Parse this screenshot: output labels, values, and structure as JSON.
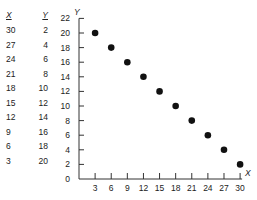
{
  "chart_data": {
    "type": "scatter",
    "title": "",
    "xlabel": "X",
    "ylabel": "Y",
    "xlim": [
      0,
      30
    ],
    "ylim": [
      0,
      22
    ],
    "x_ticks": [
      3,
      6,
      9,
      12,
      15,
      18,
      21,
      24,
      27,
      30
    ],
    "y_ticks": [
      0,
      2,
      4,
      6,
      8,
      10,
      12,
      14,
      16,
      18,
      20,
      22
    ],
    "grid": false,
    "legend": null,
    "points": [
      {
        "x": 3,
        "y": 20
      },
      {
        "x": 6,
        "y": 18
      },
      {
        "x": 9,
        "y": 16
      },
      {
        "x": 12,
        "y": 14
      },
      {
        "x": 15,
        "y": 12
      },
      {
        "x": 18,
        "y": 10
      },
      {
        "x": 21,
        "y": 8
      },
      {
        "x": 24,
        "y": 6
      },
      {
        "x": 27,
        "y": 4
      },
      {
        "x": 30,
        "y": 2
      }
    ]
  },
  "table": {
    "headers": {
      "x": "X",
      "y": "Y"
    },
    "rows": [
      {
        "x": "30",
        "y": "2"
      },
      {
        "x": "27",
        "y": "4"
      },
      {
        "x": "24",
        "y": "6"
      },
      {
        "x": "21",
        "y": "8"
      },
      {
        "x": "18",
        "y": "10"
      },
      {
        "x": "15",
        "y": "12"
      },
      {
        "x": "12",
        "y": "14"
      },
      {
        "x": "9",
        "y": "16"
      },
      {
        "x": "6",
        "y": "18"
      },
      {
        "x": "3",
        "y": "20"
      }
    ]
  },
  "colors": {
    "point": "#111111",
    "axis": "#333333",
    "text": "#222222"
  }
}
